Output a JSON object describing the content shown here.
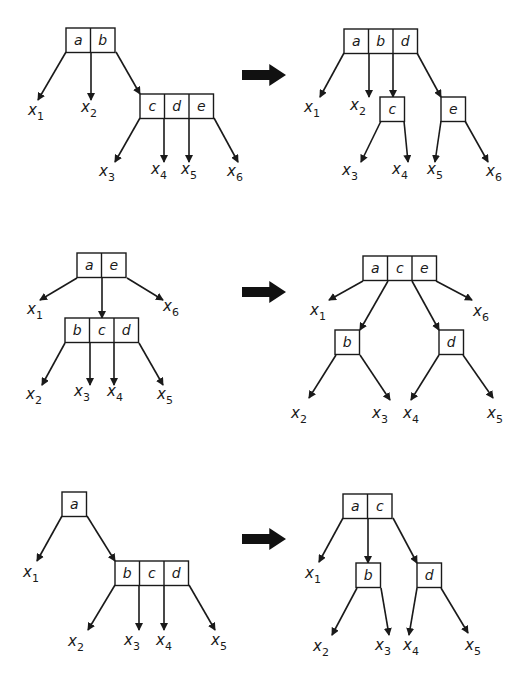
{
  "colors": {
    "stroke": "#1a1a1a",
    "arrow": "#111111",
    "background": "#ffffff"
  },
  "cell_size": 24.5,
  "rows": [
    {
      "id": "row1",
      "transform_arrow": {
        "x": 242,
        "y": 75,
        "w": 44,
        "h": 22
      },
      "before": {
        "nodes": [
          {
            "id": "ab",
            "keys": [
              "a",
              "b"
            ],
            "x": 66,
            "y": 28
          },
          {
            "id": "cde",
            "keys": [
              "c",
              "d",
              "e"
            ],
            "x": 140,
            "y": 94
          }
        ],
        "edges": [
          {
            "from": [
              66,
              52
            ],
            "to": [
              38,
              100
            ]
          },
          {
            "from": [
              91,
              52
            ],
            "to": [
              91,
              100
            ]
          },
          {
            "from": [
              116,
              52
            ],
            "to": [
              140,
              94
            ]
          },
          {
            "from": [
              140,
              118
            ],
            "to": [
              115,
              162
            ]
          },
          {
            "from": [
              164,
              118
            ],
            "to": [
              164,
              162
            ]
          },
          {
            "from": [
              189,
              118
            ],
            "to": [
              189,
              162
            ]
          },
          {
            "from": [
              214,
              118
            ],
            "to": [
              238,
              162
            ]
          }
        ],
        "leaves": [
          {
            "name": "x",
            "sub": "1",
            "x": 28,
            "y": 115
          },
          {
            "name": "x",
            "sub": "2",
            "x": 81,
            "y": 112
          },
          {
            "name": "x",
            "sub": "3",
            "x": 99,
            "y": 176
          },
          {
            "name": "x",
            "sub": "4",
            "x": 151,
            "y": 174
          },
          {
            "name": "x",
            "sub": "5",
            "x": 181,
            "y": 174
          },
          {
            "name": "x",
            "sub": "6",
            "x": 227,
            "y": 176
          }
        ]
      },
      "after": {
        "nodes": [
          {
            "id": "abd",
            "keys": [
              "a",
              "b",
              "d"
            ],
            "x": 344,
            "y": 29
          },
          {
            "id": "c",
            "keys": [
              "c"
            ],
            "x": 380,
            "y": 97
          },
          {
            "id": "e",
            "keys": [
              "e"
            ],
            "x": 441,
            "y": 97
          }
        ],
        "edges": [
          {
            "from": [
              344,
              53
            ],
            "to": [
              320,
              97
            ]
          },
          {
            "from": [
              369,
              53
            ],
            "to": [
              369,
              97
            ]
          },
          {
            "from": [
              393,
              53
            ],
            "to": [
              393,
              97
            ]
          },
          {
            "from": [
              417,
              53
            ],
            "to": [
              441,
              97
            ]
          },
          {
            "from": [
              381,
              121
            ],
            "to": [
              361,
              162
            ]
          },
          {
            "from": [
              404,
              121
            ],
            "to": [
              408,
              162
            ]
          },
          {
            "from": [
              441,
              121
            ],
            "to": [
              435,
              162
            ]
          },
          {
            "from": [
              465,
              121
            ],
            "to": [
              488,
              162
            ]
          }
        ],
        "leaves": [
          {
            "name": "x",
            "sub": "1",
            "x": 304,
            "y": 112
          },
          {
            "name": "x",
            "sub": "2",
            "x": 350,
            "y": 110
          },
          {
            "name": "x",
            "sub": "3",
            "x": 342,
            "y": 175
          },
          {
            "name": "x",
            "sub": "4",
            "x": 392,
            "y": 174
          },
          {
            "name": "x",
            "sub": "5",
            "x": 427,
            "y": 174
          },
          {
            "name": "x",
            "sub": "6",
            "x": 486,
            "y": 176
          }
        ]
      }
    },
    {
      "id": "row2",
      "transform_arrow": {
        "x": 242,
        "y": 292,
        "w": 44,
        "h": 22
      },
      "before": {
        "nodes": [
          {
            "id": "ae",
            "keys": [
              "a",
              "e"
            ],
            "x": 77,
            "y": 253
          },
          {
            "id": "bcd",
            "keys": [
              "b",
              "c",
              "d"
            ],
            "x": 65,
            "y": 318
          }
        ],
        "edges": [
          {
            "from": [
              77,
              278
            ],
            "to": [
              40,
              300
            ]
          },
          {
            "from": [
              102,
              278
            ],
            "to": [
              102,
              318
            ]
          },
          {
            "from": [
              127,
              278
            ],
            "to": [
              163,
              300
            ]
          },
          {
            "from": [
              65,
              343
            ],
            "to": [
              42,
              385
            ]
          },
          {
            "from": [
              90,
              343
            ],
            "to": [
              90,
              385
            ]
          },
          {
            "from": [
              114,
              343
            ],
            "to": [
              114,
              385
            ]
          },
          {
            "from": [
              139,
              343
            ],
            "to": [
              163,
              385
            ]
          }
        ],
        "leaves": [
          {
            "name": "x",
            "sub": "1",
            "x": 27,
            "y": 314
          },
          {
            "name": "x",
            "sub": "6",
            "x": 163,
            "y": 311
          },
          {
            "name": "x",
            "sub": "2",
            "x": 26,
            "y": 399
          },
          {
            "name": "x",
            "sub": "3",
            "x": 74,
            "y": 396
          },
          {
            "name": "x",
            "sub": "4",
            "x": 107,
            "y": 396
          },
          {
            "name": "x",
            "sub": "5",
            "x": 157,
            "y": 399
          }
        ]
      },
      "after": {
        "nodes": [
          {
            "id": "ace",
            "keys": [
              "a",
              "c",
              "e"
            ],
            "x": 363,
            "y": 256
          },
          {
            "id": "b",
            "keys": [
              "b"
            ],
            "x": 335,
            "y": 330
          },
          {
            "id": "d",
            "keys": [
              "d"
            ],
            "x": 439,
            "y": 330
          }
        ],
        "edges": [
          {
            "from": [
              363,
              281
            ],
            "to": [
              329,
              300
            ]
          },
          {
            "from": [
              388,
              281
            ],
            "to": [
              360,
              330
            ]
          },
          {
            "from": [
              412,
              281
            ],
            "to": [
              439,
              330
            ]
          },
          {
            "from": [
              436,
              281
            ],
            "to": [
              472,
              300
            ]
          },
          {
            "from": [
              336,
              355
            ],
            "to": [
              309,
              398
            ]
          },
          {
            "from": [
              360,
              355
            ],
            "to": [
              390,
              400
            ]
          },
          {
            "from": [
              439,
              355
            ],
            "to": [
              411,
              400
            ]
          },
          {
            "from": [
              463,
              355
            ],
            "to": [
              493,
              398
            ]
          }
        ],
        "leaves": [
          {
            "name": "x",
            "sub": "1",
            "x": 310,
            "y": 315
          },
          {
            "name": "x",
            "sub": "6",
            "x": 473,
            "y": 316
          },
          {
            "name": "x",
            "sub": "2",
            "x": 291,
            "y": 418
          },
          {
            "name": "x",
            "sub": "3",
            "x": 372,
            "y": 418
          },
          {
            "name": "x",
            "sub": "4",
            "x": 403,
            "y": 418
          },
          {
            "name": "x",
            "sub": "5",
            "x": 487,
            "y": 418
          }
        ]
      }
    },
    {
      "id": "row3",
      "transform_arrow": {
        "x": 242,
        "y": 539,
        "w": 44,
        "h": 22
      },
      "before": {
        "nodes": [
          {
            "id": "a",
            "keys": [
              "a"
            ],
            "x": 62,
            "y": 492
          },
          {
            "id": "bcd",
            "keys": [
              "b",
              "c",
              "d"
            ],
            "x": 115,
            "y": 561
          }
        ],
        "edges": [
          {
            "from": [
              62,
              516
            ],
            "to": [
              37,
              561
            ]
          },
          {
            "from": [
              87,
              516
            ],
            "to": [
              115,
              561
            ]
          },
          {
            "from": [
              115,
              585
            ],
            "to": [
              88,
              630
            ]
          },
          {
            "from": [
              139,
              585
            ],
            "to": [
              139,
              630
            ]
          },
          {
            "from": [
              164,
              585
            ],
            "to": [
              164,
              630
            ]
          },
          {
            "from": [
              189,
              585
            ],
            "to": [
              215,
              630
            ]
          }
        ],
        "leaves": [
          {
            "name": "x",
            "sub": "1",
            "x": 23,
            "y": 577
          },
          {
            "name": "x",
            "sub": "2",
            "x": 68,
            "y": 646
          },
          {
            "name": "x",
            "sub": "3",
            "x": 124,
            "y": 645
          },
          {
            "name": "x",
            "sub": "4",
            "x": 156,
            "y": 645
          },
          {
            "name": "x",
            "sub": "5",
            "x": 211,
            "y": 645
          }
        ]
      },
      "after": {
        "nodes": [
          {
            "id": "ac",
            "keys": [
              "a",
              "c"
            ],
            "x": 343,
            "y": 494
          },
          {
            "id": "b",
            "keys": [
              "b"
            ],
            "x": 356,
            "y": 563
          },
          {
            "id": "d",
            "keys": [
              "d"
            ],
            "x": 417,
            "y": 563
          }
        ],
        "edges": [
          {
            "from": [
              343,
              518
            ],
            "to": [
              319,
              562
            ]
          },
          {
            "from": [
              368,
              518
            ],
            "to": [
              368,
              563
            ]
          },
          {
            "from": [
              393,
              518
            ],
            "to": [
              417,
              563
            ]
          },
          {
            "from": [
              357,
              588
            ],
            "to": [
              332,
              635
            ]
          },
          {
            "from": [
              381,
              588
            ],
            "to": [
              389,
              635
            ]
          },
          {
            "from": [
              417,
              588
            ],
            "to": [
              409,
              635
            ]
          },
          {
            "from": [
              441,
              588
            ],
            "to": [
              468,
              633
            ]
          }
        ],
        "leaves": [
          {
            "name": "x",
            "sub": "1",
            "x": 305,
            "y": 578
          },
          {
            "name": "x",
            "sub": "2",
            "x": 313,
            "y": 651
          },
          {
            "name": "x",
            "sub": "3",
            "x": 375,
            "y": 650
          },
          {
            "name": "x",
            "sub": "4",
            "x": 403,
            "y": 650
          },
          {
            "name": "x",
            "sub": "5",
            "x": 465,
            "y": 650
          }
        ]
      }
    }
  ]
}
